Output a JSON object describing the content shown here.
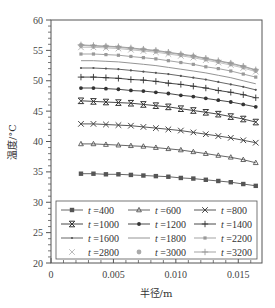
{
  "chart_data": {
    "type": "line",
    "title": "",
    "xlabel": "半径/m",
    "ylabel": "温度/°C",
    "xlim": [
      0,
      0.0169
    ],
    "ylim": [
      20,
      60
    ],
    "x_ticks": [
      0,
      0.005,
      0.01,
      0.015
    ],
    "x_tick_labels": [
      "0",
      "0.005",
      "0.010",
      "0.015"
    ],
    "y_ticks": [
      20,
      25,
      30,
      35,
      40,
      45,
      50,
      55,
      60
    ],
    "y_tick_labels": [
      "20",
      "25",
      "30",
      "35",
      "40",
      "45",
      "50",
      "55",
      "60"
    ],
    "grid": false,
    "legend_position": "lower center (inside plot, 3 columns)",
    "x": [
      0.0024,
      0.0034,
      0.0044,
      0.0054,
      0.0064,
      0.0074,
      0.0084,
      0.0094,
      0.0104,
      0.0114,
      0.0124,
      0.0134,
      0.0144,
      0.0154,
      0.0164
    ],
    "series": [
      {
        "name": "t =400",
        "marker": "square",
        "color": "#555555",
        "values": [
          34.7,
          34.7,
          34.6,
          34.6,
          34.5,
          34.4,
          34.3,
          34.2,
          34.0,
          33.9,
          33.7,
          33.5,
          33.3,
          33.0,
          32.7
        ]
      },
      {
        "name": "t =600",
        "marker": "triangle",
        "color": "#555555",
        "values": [
          39.6,
          39.6,
          39.5,
          39.4,
          39.3,
          39.2,
          39.0,
          38.8,
          38.6,
          38.3,
          38.0,
          37.7,
          37.4,
          37.0,
          36.5
        ]
      },
      {
        "name": "t =800",
        "marker": "x",
        "color": "#444444",
        "values": [
          42.9,
          42.9,
          42.8,
          42.7,
          42.6,
          42.4,
          42.2,
          42.0,
          41.8,
          41.5,
          41.2,
          40.9,
          40.6,
          40.2,
          39.8
        ]
      },
      {
        "name": "t =1000",
        "marker": "star-x",
        "color": "#333333",
        "values": [
          46.7,
          46.6,
          46.5,
          46.4,
          46.3,
          46.1,
          45.9,
          45.7,
          45.4,
          45.1,
          44.8,
          44.5,
          44.1,
          43.7,
          43.2
        ]
      },
      {
        "name": "t =1200",
        "marker": "dot",
        "color": "#333333",
        "values": [
          48.8,
          48.8,
          48.7,
          48.6,
          48.4,
          48.3,
          48.1,
          47.9,
          47.6,
          47.4,
          47.1,
          46.8,
          46.5,
          46.1,
          45.7
        ]
      },
      {
        "name": "t =1400",
        "marker": "plus",
        "color": "#333333",
        "values": [
          50.6,
          50.6,
          50.5,
          50.4,
          50.2,
          50.1,
          49.9,
          49.6,
          49.4,
          49.1,
          48.8,
          48.4,
          48.1,
          47.7,
          47.2
        ]
      },
      {
        "name": "t =1600",
        "marker": "small-dot",
        "color": "#555555",
        "values": [
          52.1,
          52.1,
          52.0,
          51.9,
          51.7,
          51.5,
          51.3,
          51.1,
          50.8,
          50.5,
          50.2,
          49.8,
          49.4,
          49.0,
          48.5
        ]
      },
      {
        "name": "t =1800",
        "marker": "none",
        "color": "#888888",
        "values": [
          53.3,
          53.3,
          53.2,
          53.1,
          52.9,
          52.7,
          52.5,
          52.2,
          51.9,
          51.6,
          51.3,
          50.9,
          50.5,
          50.0,
          49.5
        ]
      },
      {
        "name": "t =2200",
        "marker": "square-small",
        "color": "#999999",
        "values": [
          54.4,
          54.4,
          54.3,
          54.2,
          54.0,
          53.8,
          53.6,
          53.3,
          53.0,
          52.7,
          52.3,
          52.0,
          51.6,
          51.1,
          50.6
        ]
      },
      {
        "name": "t =2800",
        "marker": "x-light",
        "color": "#bbbbbb",
        "values": [
          55.5,
          55.5,
          55.4,
          55.3,
          55.1,
          54.9,
          54.7,
          54.4,
          54.1,
          53.8,
          53.4,
          53.0,
          52.6,
          52.1,
          51.5
        ]
      },
      {
        "name": "t =3000",
        "marker": "circle-light",
        "color": "#aaaaaa",
        "values": [
          55.8,
          55.7,
          55.6,
          55.5,
          55.3,
          55.1,
          54.9,
          54.6,
          54.3,
          54.0,
          53.6,
          53.2,
          52.8,
          52.3,
          51.7
        ]
      },
      {
        "name": "t =3200",
        "marker": "plus-light",
        "color": "#999999",
        "values": [
          55.9,
          55.8,
          55.7,
          55.6,
          55.4,
          55.2,
          55.0,
          54.7,
          54.4,
          54.1,
          53.7,
          53.3,
          52.9,
          52.4,
          51.8
        ]
      }
    ]
  },
  "legend": {
    "items": [
      {
        "label": "t =400"
      },
      {
        "label": "t =600"
      },
      {
        "label": "t =800"
      },
      {
        "label": "t =1000"
      },
      {
        "label": "t =1200"
      },
      {
        "label": "t =1400"
      },
      {
        "label": "t =1600"
      },
      {
        "label": "t =1800"
      },
      {
        "label": "t =2200"
      },
      {
        "label": "t =2800"
      },
      {
        "label": "t =3000"
      },
      {
        "label": "t =3200"
      }
    ]
  },
  "axes": {
    "xlabel": "半径/m",
    "ylabel": "温度/°C"
  }
}
